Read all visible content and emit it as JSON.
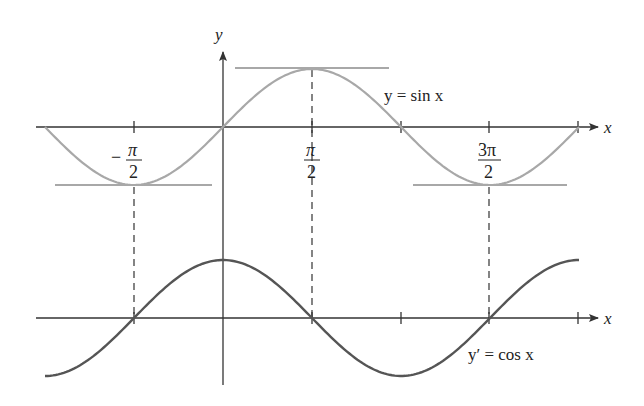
{
  "figure": {
    "top_curve_label": "y = sin x",
    "bottom_curve_label": "y′ = cos x",
    "y_axis_label": "y",
    "x_axis_label": "x",
    "tick_labels": [
      {
        "id": "neg_half_pi",
        "sign": "−",
        "numerator": "π",
        "denominator": "2"
      },
      {
        "id": "half_pi",
        "sign": "",
        "numerator": "π",
        "denominator": "2"
      },
      {
        "id": "three_half_pi",
        "sign": "",
        "numerator": "3π",
        "denominator": "2"
      }
    ],
    "colors": {
      "sin_curve": "#a8a8a8",
      "tangent_lines": "#a8a8a8",
      "cos_curve": "#555555",
      "axes": "#333333",
      "dashed_guides": "#333333"
    }
  },
  "chart_data": [
    {
      "type": "line",
      "title": "y = sin x",
      "xlabel": "x",
      "ylabel": "y",
      "x_range": [
        -3.1416,
        6.2832
      ],
      "y_range": [
        -1,
        1
      ],
      "ticks": [
        "-π/2",
        "π/2",
        "π",
        "3π/2",
        "2π"
      ],
      "tick_values": [
        -1.5708,
        1.5708,
        3.1416,
        4.7124,
        6.2832
      ],
      "horizontal_tangents": [
        {
          "x": -1.5708,
          "y": -1
        },
        {
          "x": 1.5708,
          "y": 1
        },
        {
          "x": 4.7124,
          "y": -1
        }
      ],
      "series": [
        {
          "name": "sin x",
          "function": "sin(x)"
        }
      ]
    },
    {
      "type": "line",
      "title": "y′ = cos x",
      "xlabel": "x",
      "ylabel": "",
      "x_range": [
        -3.1416,
        6.2832
      ],
      "y_range": [
        -1,
        1
      ],
      "zeros_marked": [
        -1.5708,
        1.5708,
        4.7124
      ],
      "series": [
        {
          "name": "cos x",
          "function": "cos(x)"
        }
      ]
    }
  ]
}
